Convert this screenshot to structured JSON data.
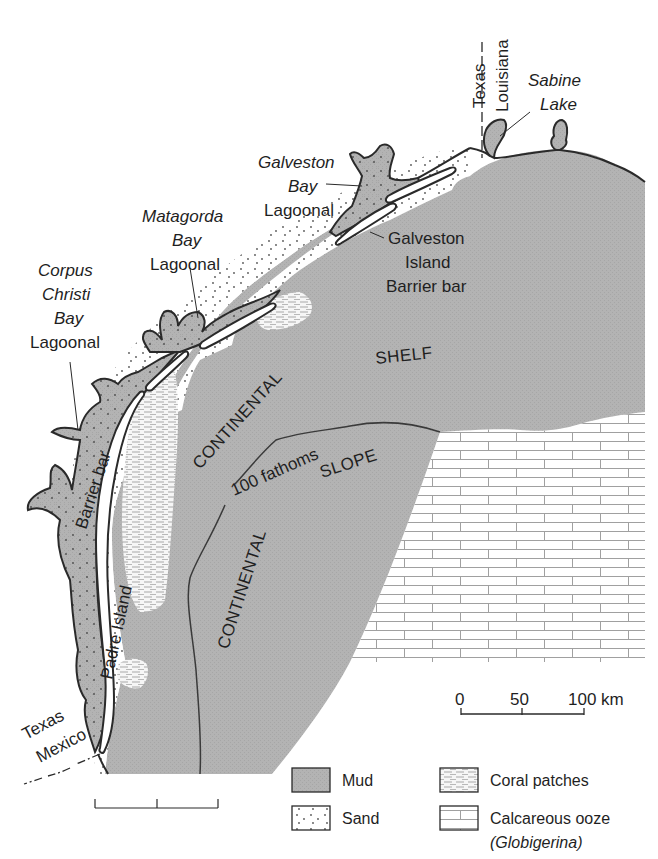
{
  "map": {
    "title_region": "Texas Gulf Coast sediment distribution",
    "colors": {
      "mud": "#b3b3b3",
      "sand": "#ffffff",
      "coral": "#f4f4f4",
      "ooze_line": "#9a9a9a",
      "outline": "#2a2a2a",
      "background": "#ffffff"
    },
    "labels": {
      "texas_top": "Texas",
      "louisiana": "Louisiana",
      "sabine_1": "Sabine",
      "sabine_2": "Lake",
      "galveston_bay_1": "Galveston",
      "galveston_bay_2": "Bay",
      "galveston_bay_3": "Lagoonal",
      "galveston_island_1": "Galveston",
      "galveston_island_2": "Island",
      "galveston_island_3": "Barrier bar",
      "matagorda_1": "Matagorda",
      "matagorda_2": "Bay",
      "matagorda_3": "Lagoonal",
      "corpus_1": "Corpus",
      "corpus_2": "Christi",
      "corpus_3": "Bay",
      "corpus_4": "Lagoonal",
      "shelf": "SHELF",
      "continental_shelf": "CONTINENTAL",
      "slope": "SLOPE",
      "continental_slope": "CONTINENTAL",
      "fathoms": "100 fathoms",
      "padre_island": "Padre Island",
      "barrier_bar": "Barrier bar",
      "texas_bottom": "Texas",
      "mexico": "Mexico"
    },
    "scale_bar": {
      "ticks": [
        "0",
        "50",
        "100 km"
      ]
    },
    "legend": {
      "items": [
        {
          "key": "mud",
          "label": "Mud"
        },
        {
          "key": "sand",
          "label": "Sand"
        },
        {
          "key": "coral",
          "label": "Coral patches"
        },
        {
          "key": "ooze",
          "label": "Calcareous ooze",
          "sublabel": "(Globigerina)"
        }
      ]
    }
  }
}
